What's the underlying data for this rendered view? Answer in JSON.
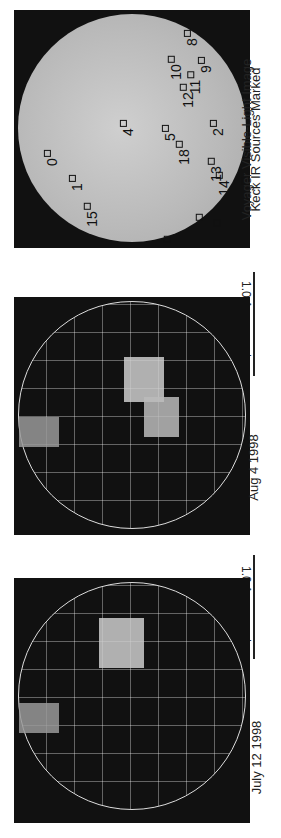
{
  "panels": [
    {
      "id": "voyager",
      "caption_line1": "Voyager Visible-Light Image",
      "caption_line2": "Keck IR Sources Marked",
      "sources": [
        {
          "n": "0",
          "x": 30,
          "y": 140
        },
        {
          "n": "1",
          "x": 55,
          "y": 165
        },
        {
          "n": "15",
          "x": 66,
          "y": 197
        },
        {
          "n": "4",
          "x": 106,
          "y": 110
        },
        {
          "n": "5",
          "x": 148,
          "y": 115
        },
        {
          "n": "18",
          "x": 158,
          "y": 135
        },
        {
          "n": "10",
          "x": 150,
          "y": 50
        },
        {
          "n": "8",
          "x": 170,
          "y": 20
        },
        {
          "n": "11",
          "x": 170,
          "y": 65
        },
        {
          "n": "12",
          "x": 162,
          "y": 78
        },
        {
          "n": "9",
          "x": 184,
          "y": 47
        },
        {
          "n": "2",
          "x": 196,
          "y": 110
        },
        {
          "n": "13",
          "x": 190,
          "y": 152
        },
        {
          "n": "14",
          "x": 198,
          "y": 166
        },
        {
          "n": "16",
          "x": 178,
          "y": 208
        },
        {
          "n": "3",
          "x": 200,
          "y": 210
        },
        {
          "n": "17",
          "x": 146,
          "y": 230
        },
        {
          "n": "6",
          "x": 228,
          "y": 168
        }
      ]
    },
    {
      "id": "aug",
      "caption": "Aug 4 1998",
      "scale": "1.0 Arcseconds",
      "sources": [
        "0",
        "1",
        "15",
        "4",
        "5",
        "18",
        "2",
        "12",
        "9",
        "19",
        "14",
        "20",
        "16",
        "3",
        "6"
      ]
    },
    {
      "id": "july",
      "caption": "July 12 1998",
      "scale": "1.0 Arcseconds",
      "sources": [
        "0",
        "1",
        "15",
        "4",
        "5",
        "10",
        "8",
        "11",
        "12",
        "9",
        "2",
        "13",
        "14",
        "16",
        "3",
        "17",
        "6"
      ]
    }
  ]
}
